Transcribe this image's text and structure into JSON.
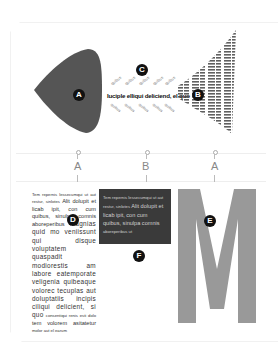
{
  "figure": {
    "type": "typographic-fish-diagram",
    "colors": {
      "fish_head": "#555555",
      "dark_box": "#3a3a3a",
      "big_letter": "#999999",
      "badge": "#111111"
    },
    "badges": {
      "a": "A",
      "b": "B",
      "c": "C",
      "d": "D",
      "e": "E",
      "f": "F"
    },
    "spine_text": "Iuciple elliqui deliciend, el quo",
    "rib_text": "quibus",
    "column_labels": [
      "A",
      "B",
      "A"
    ],
    "column_a": {
      "line_small": "Tem repernis lessecumqui ut aut",
      "line_small2": "restur, sinlotes",
      "body": "Alit dolupit et licab ipit, con cum quibus, sinulpa comnis aboreperibus",
      "body2": "magnias quid mo veniissunt qui disque voluptatem quaspadit modiorestis am labore eatemporate veligenia quibeaque volorec tecuplas aut doluptatiis incipis ciliqui delicient, si quo",
      "tail_small": "consentiqui renis esti dolo",
      "tail": "tem volorem asitatetur",
      "tail_small2": "molor aut el earum"
    },
    "column_b": {
      "line_small": "Tem repernis lessecumqui ut aut",
      "line_small2": "restur, sinlotes",
      "body": "Alit dolupit et licab ipit, con cum quibus, sinulpa comnis",
      "tail_small": "aboreperibus ut"
    },
    "big_letter": "M"
  }
}
